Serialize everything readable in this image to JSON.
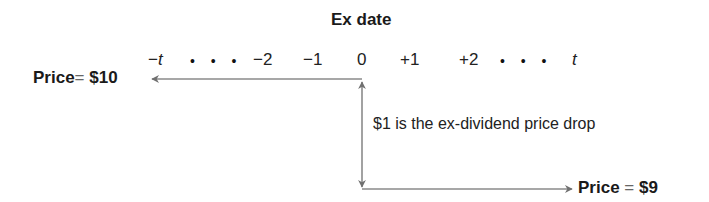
{
  "title": "Ex date",
  "timeline": {
    "ticks": [
      {
        "label": "−t",
        "italic_part": "t"
      },
      {
        "label": "• • •"
      },
      {
        "label": "−2"
      },
      {
        "label": "−1"
      },
      {
        "label": "0"
      },
      {
        "label": "+1"
      },
      {
        "label": "+2"
      },
      {
        "label": "• • •"
      },
      {
        "label": "t"
      }
    ]
  },
  "before": {
    "label": "Price",
    "eq": "=",
    "value": "$10"
  },
  "after": {
    "label": "Price",
    "eq": "=",
    "value": "$9"
  },
  "annotation": "$1 is the ex-dividend price drop",
  "colors": {
    "arrow": "#808080",
    "text": "#1a1a1a"
  }
}
